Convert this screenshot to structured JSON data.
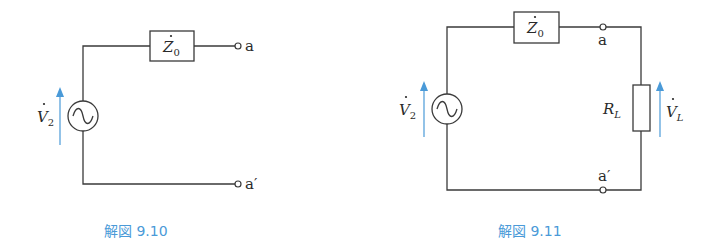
{
  "figures": [
    {
      "id": "fig-9-10",
      "caption": "解図 9.10",
      "source_label": "V",
      "source_subscript": "2",
      "impedance_label": "Z",
      "impedance_subscript": "0",
      "terminal_top": "a",
      "terminal_bottom": "a′"
    },
    {
      "id": "fig-9-11",
      "caption": "解図 9.11",
      "source_label": "V",
      "source_subscript": "2",
      "impedance_label": "Z",
      "impedance_subscript": "0",
      "terminal_top": "a",
      "terminal_bottom": "a′",
      "load_label": "R",
      "load_subscript": "L",
      "load_voltage_label": "V",
      "load_voltage_subscript": "L"
    }
  ],
  "colors": {
    "wire": "#3a3a3a",
    "accent": "#4a9ad8",
    "background": "#ffffff"
  }
}
